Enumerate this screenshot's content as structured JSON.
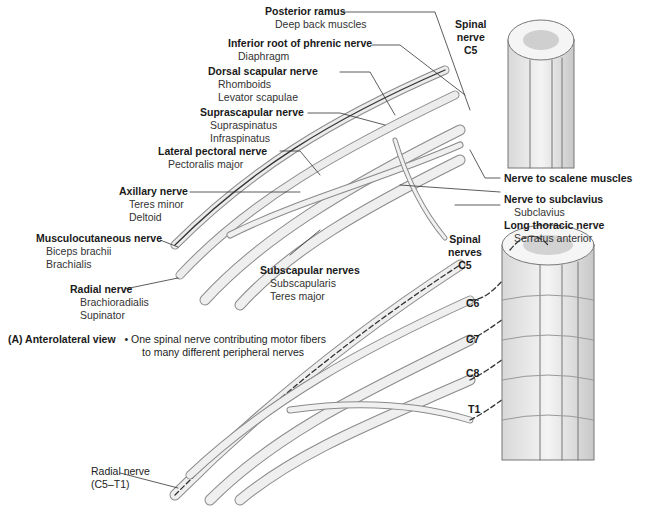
{
  "figure": {
    "view_label": "(A) Anterolateral view",
    "caption_bullet": "•",
    "caption_lines": [
      "One spinal nerve contributing motor fibers",
      "to many different peripheral nerves"
    ]
  },
  "top_diagram": {
    "spinal_nerve_label": [
      "Spinal",
      "nerve",
      "C5"
    ],
    "nerves": [
      {
        "name": "Posterior ramus",
        "targets": [
          "Deep back muscles"
        ]
      },
      {
        "name": "Inferior root of phrenic nerve",
        "targets": [
          "Diaphragm"
        ]
      },
      {
        "name": "Dorsal scapular nerve",
        "targets": [
          "Rhomboids",
          "Levator scapulae"
        ]
      },
      {
        "name": "Suprascapular nerve",
        "targets": [
          "Supraspinatus",
          "Infraspinatus"
        ]
      },
      {
        "name": "Lateral pectoral nerve",
        "targets": [
          "Pectoralis major"
        ]
      },
      {
        "name": "Axillary nerve",
        "targets": [
          "Teres minor",
          "Deltoid"
        ]
      },
      {
        "name": "Musculocutaneous nerve",
        "targets": [
          "Biceps brachii",
          "Brachialis"
        ]
      },
      {
        "name": "Radial nerve",
        "targets": [
          "Brachioradialis",
          "Supinator"
        ]
      },
      {
        "name": "Subscapular nerves",
        "targets": [
          "Subscapularis",
          "Teres major"
        ]
      },
      {
        "name": "Nerve to scalene muscles",
        "targets": []
      },
      {
        "name": "Nerve to subclavius",
        "targets": [
          "Subclavius"
        ]
      },
      {
        "name": "Long thoracic nerve",
        "targets": [
          "Serratus anterior"
        ]
      }
    ]
  },
  "bottom_diagram": {
    "spinal_nerves_label": [
      "Spinal",
      "nerves"
    ],
    "levels": [
      "C5",
      "C6",
      "C7",
      "C8",
      "T1"
    ],
    "radial_label": [
      "Radial nerve",
      "(C5–T1)"
    ]
  }
}
